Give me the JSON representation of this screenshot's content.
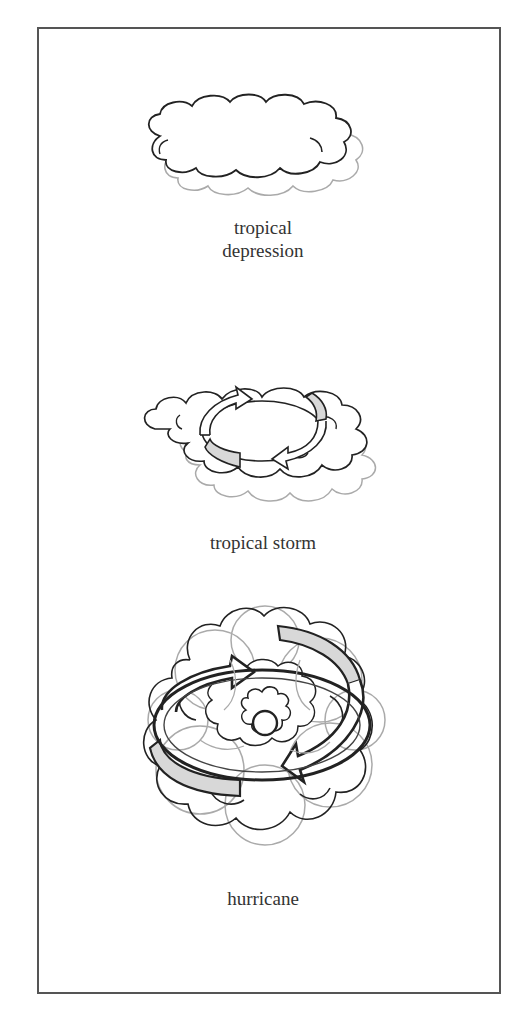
{
  "diagram": {
    "stages": [
      {
        "id": "tropical-depression",
        "caption_lines": [
          "tropical",
          "depression"
        ],
        "illustration": "single-cloud-cluster"
      },
      {
        "id": "tropical-storm",
        "caption_lines": [
          "tropical storm"
        ],
        "illustration": "cloud-cluster-with-rotating-arrows"
      },
      {
        "id": "hurricane",
        "caption_lines": [
          "hurricane"
        ],
        "illustration": "organized-cloud-mass-with-eye-and-rotation-arrows"
      }
    ],
    "colors": {
      "frame": "#555555",
      "cloud_outline_dark": "#222222",
      "cloud_outline_light": "#aaaaaa",
      "arrow_fill": "#d8d8d8",
      "text": "#333333",
      "background": "#ffffff"
    }
  }
}
